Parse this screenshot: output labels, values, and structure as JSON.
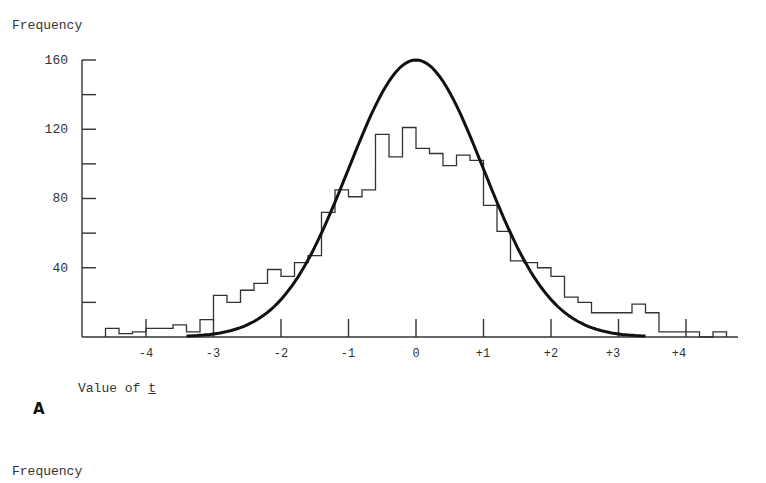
{
  "chart_data": {
    "type": "bar",
    "subtype": "histogram_with_normal_curve",
    "title": "",
    "xlabel": "Value of t",
    "ylabel": "Frequency",
    "panel_label": "A",
    "xlim": [
      -4.6,
      4.8
    ],
    "ylim": [
      0,
      160
    ],
    "x_ticks": [
      "-4",
      "-3",
      "-2",
      "-1",
      "0",
      "+1",
      "+2",
      "+3",
      "+4"
    ],
    "x_tick_values": [
      -4,
      -3,
      -2,
      -1,
      0,
      1,
      2,
      3,
      4
    ],
    "y_ticks": [
      "40",
      "80",
      "120",
      "160"
    ],
    "y_tick_values": [
      40,
      80,
      120,
      160
    ],
    "y_minor_ticks": [
      20,
      60,
      100,
      140
    ],
    "grid": false,
    "series": [
      {
        "name": "Observed frequency (histogram)",
        "style": "step",
        "bin_width": 0.2,
        "bins": [
          {
            "x0": -4.6,
            "x1": -4.4,
            "value": 5
          },
          {
            "x0": -4.4,
            "x1": -4.2,
            "value": 2
          },
          {
            "x0": -4.2,
            "x1": -4.0,
            "value": 3
          },
          {
            "x0": -4.0,
            "x1": -3.6,
            "value": 5
          },
          {
            "x0": -3.6,
            "x1": -3.4,
            "value": 7
          },
          {
            "x0": -3.4,
            "x1": -3.2,
            "value": 3
          },
          {
            "x0": -3.2,
            "x1": -3.0,
            "value": 10
          },
          {
            "x0": -3.0,
            "x1": -2.8,
            "value": 24
          },
          {
            "x0": -2.8,
            "x1": -2.6,
            "value": 20
          },
          {
            "x0": -2.6,
            "x1": -2.4,
            "value": 27
          },
          {
            "x0": -2.4,
            "x1": -2.2,
            "value": 31
          },
          {
            "x0": -2.2,
            "x1": -2.0,
            "value": 39
          },
          {
            "x0": -2.0,
            "x1": -1.8,
            "value": 35
          },
          {
            "x0": -1.8,
            "x1": -1.6,
            "value": 43
          },
          {
            "x0": -1.6,
            "x1": -1.4,
            "value": 47
          },
          {
            "x0": -1.4,
            "x1": -1.2,
            "value": 72
          },
          {
            "x0": -1.2,
            "x1": -1.0,
            "value": 85
          },
          {
            "x0": -1.0,
            "x1": -0.8,
            "value": 81
          },
          {
            "x0": -0.8,
            "x1": -0.6,
            "value": 85
          },
          {
            "x0": -0.6,
            "x1": -0.4,
            "value": 117
          },
          {
            "x0": -0.4,
            "x1": -0.2,
            "value": 104
          },
          {
            "x0": -0.2,
            "x1": 0.0,
            "value": 121
          },
          {
            "x0": 0.0,
            "x1": 0.2,
            "value": 109
          },
          {
            "x0": 0.2,
            "x1": 0.4,
            "value": 106
          },
          {
            "x0": 0.4,
            "x1": 0.6,
            "value": 99
          },
          {
            "x0": 0.6,
            "x1": 0.8,
            "value": 105
          },
          {
            "x0": 0.8,
            "x1": 1.0,
            "value": 102
          },
          {
            "x0": 1.0,
            "x1": 1.2,
            "value": 76
          },
          {
            "x0": 1.2,
            "x1": 1.4,
            "value": 61
          },
          {
            "x0": 1.4,
            "x1": 1.6,
            "value": 44
          },
          {
            "x0": 1.6,
            "x1": 1.8,
            "value": 43
          },
          {
            "x0": 1.8,
            "x1": 2.0,
            "value": 40
          },
          {
            "x0": 2.0,
            "x1": 2.2,
            "value": 35
          },
          {
            "x0": 2.2,
            "x1": 2.4,
            "value": 23
          },
          {
            "x0": 2.4,
            "x1": 2.6,
            "value": 20
          },
          {
            "x0": 2.6,
            "x1": 2.8,
            "value": 14
          },
          {
            "x0": 2.8,
            "x1": 3.2,
            "value": 14
          },
          {
            "x0": 3.2,
            "x1": 3.4,
            "value": 19
          },
          {
            "x0": 3.4,
            "x1": 3.6,
            "value": 14
          },
          {
            "x0": 3.6,
            "x1": 4.2,
            "value": 3
          },
          {
            "x0": 4.2,
            "x1": 4.4,
            "value": 0
          },
          {
            "x0": 4.4,
            "x1": 4.6,
            "value": 3
          }
        ]
      },
      {
        "name": "Theoretical normal curve",
        "style": "line",
        "x": [
          -3.4,
          -3.0,
          -2.5,
          -2.0,
          -1.5,
          -1.0,
          -0.5,
          0.0,
          0.5,
          1.0,
          1.5,
          2.0,
          2.5,
          3.0,
          3.4
        ],
        "values": [
          1,
          5,
          13,
          24,
          42,
          79,
          130,
          160,
          130,
          79,
          42,
          24,
          13,
          5,
          1
        ]
      }
    ],
    "annotations": [
      "second panel y-axis label 'Frequency' visible at bottom"
    ]
  },
  "labels": {
    "ylabel_top": "Frequency",
    "xlabel_prefix": "Value of ",
    "xlabel_var": "t",
    "panel_letter": "A",
    "ylabel_bottom": "Frequency"
  },
  "ticks": {
    "y": [
      "160",
      "120",
      "80",
      "40"
    ],
    "x": [
      "-4",
      "-3",
      "-2",
      "-1",
      "0",
      "+1",
      "+2",
      "+3",
      "+4"
    ]
  }
}
